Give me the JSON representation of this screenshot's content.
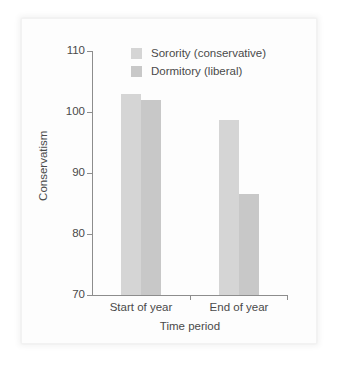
{
  "chart_data": {
    "type": "bar",
    "title": "",
    "xlabel": "Time period",
    "ylabel": "Conservatism",
    "categories": [
      "Start of year",
      "End of year"
    ],
    "series": [
      {
        "name": "Sorority (conservative)",
        "color": "#d5d5d5",
        "values": [
          103,
          98.7
        ]
      },
      {
        "name": "Dormitory (liberal)",
        "color": "#c8c8c8",
        "values": [
          102,
          86.5
        ]
      }
    ],
    "ylim": [
      70,
      110
    ],
    "yticks": [
      70,
      80,
      90,
      100,
      110
    ],
    "ytick_labels": [
      "70",
      "80",
      "90",
      "100",
      "110"
    ],
    "grid": false,
    "legend_position": "top-center"
  },
  "axes": {
    "y_title": "Conservatism",
    "x_title": "Time period"
  },
  "legend": {
    "entries": [
      {
        "label": "Sorority (conservative)",
        "color": "#d5d5d5"
      },
      {
        "label": "Dormitory (liberal)",
        "color": "#c8c8c8"
      }
    ]
  }
}
